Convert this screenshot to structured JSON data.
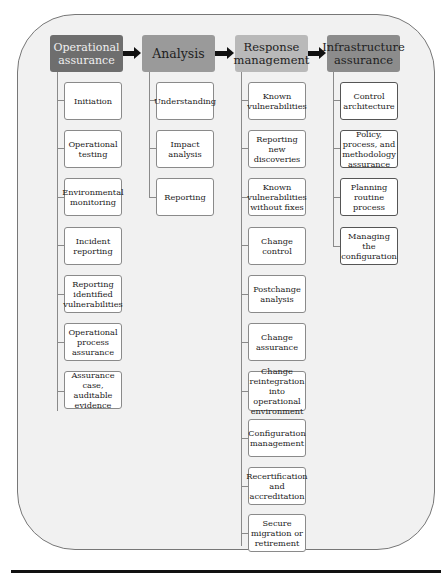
{
  "diagram": {
    "columns": [
      {
        "header": "Operational assurance",
        "header_color": "#6e6e6e",
        "items": [
          "Initiation",
          "Operational testing",
          "Environmental monitoring",
          "Incident reporting",
          "Reporting identified vulnerabilities",
          "Operational process assurance",
          "Assurance case, auditable evidence"
        ]
      },
      {
        "header": "Analysis",
        "header_color": "#9a9a9a",
        "items": [
          "Understanding",
          "Impact analysis",
          "Reporting"
        ]
      },
      {
        "header": "Response management",
        "header_color": "#b9b9b9",
        "items": [
          "Known vulnerabilities",
          "Reporting new discoveries",
          "Known vulnerabilities without fixes",
          "Change control",
          "Postchange analysis",
          "Change assurance",
          "Change reintegration into operational environment",
          "Configuration management",
          "Recertification and accreditation",
          "Secure migration or retirement"
        ]
      },
      {
        "header": "Infrastructure assurance",
        "header_color": "#8c8c8c",
        "items": [
          "Control architecture",
          "Policy, process, and methodology assurance",
          "Planning routine process",
          "Managing the configuration"
        ]
      }
    ]
  }
}
